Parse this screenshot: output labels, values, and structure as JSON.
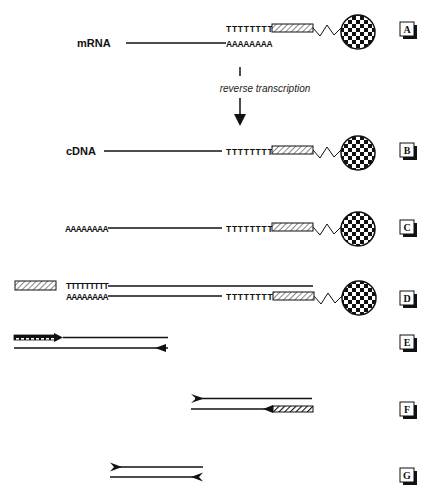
{
  "figure": {
    "colors": {
      "ink": "#111111",
      "background": "#ffffff",
      "hatch_light": "#d9d9d9"
    }
  },
  "step_a": {
    "panel": "A",
    "molecule_label": "mRNA",
    "oligo_dt": "TTTTTTTT",
    "poly_a": "AAAAAAAA"
  },
  "transition": {
    "caption": "reverse transcription"
  },
  "step_b": {
    "panel": "B",
    "molecule_label": "cDNA",
    "oligo_dt": "TTTTTTTT"
  },
  "step_c": {
    "panel": "C",
    "poly_a_tail": "AAAAAAAA",
    "oligo_dt": "TTTTTTTT"
  },
  "step_d": {
    "panel": "D",
    "primer_dt": "TTTTTTTTT",
    "poly_a_tail": "AAAAAAAA",
    "oligo_dt": "TTTTTTTT"
  },
  "step_e": {
    "panel": "E"
  },
  "step_f": {
    "panel": "F"
  },
  "step_g": {
    "panel": "G"
  }
}
